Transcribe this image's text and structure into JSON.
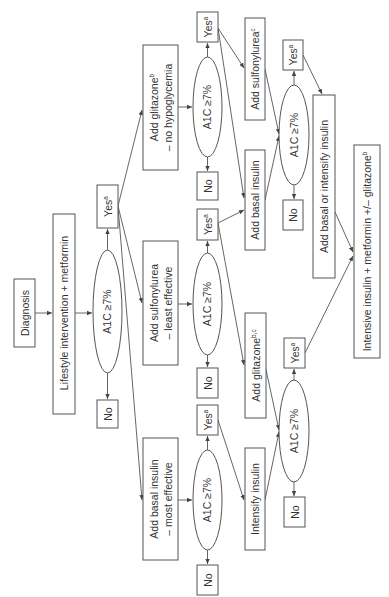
{
  "diagram": {
    "orientation": "rotated 90deg counter-clockwise",
    "nodes": {
      "diagnosis": {
        "label": "Diagnosis"
      },
      "lifestyle": {
        "label": "Lifestyle intervention + metformin"
      },
      "check1": {
        "label": "A1C ≥7%"
      },
      "yes1": {
        "label": "Yes",
        "sup": "a"
      },
      "no1": {
        "label": "No"
      },
      "glitazone_step": {
        "line1": "Add glitazone",
        "line1_sup": "b",
        "line2": "– no hypoglycemia"
      },
      "sulfonylurea_step": {
        "line1": "Add sulfonylurea",
        "line2": "– least effective"
      },
      "basal_step": {
        "line1": "Add basal insulin",
        "line2": "– most effective"
      },
      "check2a": {
        "label": "A1C ≥7%"
      },
      "yes2a": {
        "label": "Yes",
        "sup": "a"
      },
      "no2a": {
        "label": "No"
      },
      "check2b": {
        "label": "A1C ≥7%"
      },
      "yes2b": {
        "label": "Yes",
        "sup": "a"
      },
      "no2b": {
        "label": "No"
      },
      "check2c": {
        "label": "A1C ≥7%"
      },
      "yes2c": {
        "label": "Yes",
        "sup": "a"
      },
      "no2c": {
        "label": "No"
      },
      "add_sulfonylurea": {
        "label": "Add sulfonylurea",
        "sup": "c"
      },
      "add_basal_insulin": {
        "label": "Add basal insulin"
      },
      "add_glitazone_bc": {
        "label": "Add glitazone",
        "sup": "b,c"
      },
      "intensify_insulin": {
        "label": "Intensify insulin"
      },
      "check3a": {
        "label": "A1C ≥7%"
      },
      "yes3a": {
        "label": "Yes",
        "sup": "a"
      },
      "no3a": {
        "label": "No"
      },
      "check3c": {
        "label": "A1C ≥7%"
      },
      "yes3c": {
        "label": "Yes",
        "sup": "a"
      },
      "no3c": {
        "label": "No"
      },
      "basal_or_intensify": {
        "label": "Add basal or intensify insulin"
      },
      "intensive": {
        "label": "Intensive insulin + metformin +/– glitazone",
        "sup": "b"
      }
    }
  }
}
